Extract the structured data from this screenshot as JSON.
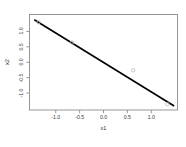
{
  "chart_data": {
    "type": "scatter",
    "title": "",
    "xlabel": "x1",
    "ylabel": "x2",
    "xlim": [
      -1.55,
      1.55
    ],
    "ylim": [
      -1.55,
      1.55
    ],
    "grid": false,
    "legend": null,
    "xticks": [
      "-1.0",
      "-0.5",
      "0.0",
      "0.5",
      "1.0"
    ],
    "xtick_values": [
      -1.0,
      -0.5,
      0.0,
      0.5,
      1.0
    ],
    "yticks": [
      "-1.0",
      "-0.5",
      "0.0",
      "0.5",
      "1.0"
    ],
    "ytick_values": [
      -1.0,
      -0.5,
      0.0,
      0.5,
      1.0
    ],
    "points": [
      {
        "x": -1.36,
        "y": 1.3
      },
      {
        "x": -0.66,
        "y": 0.64
      },
      {
        "x": 0.62,
        "y": -0.26
      },
      {
        "x": 1.34,
        "y": -1.36
      }
    ],
    "line": {
      "name": "fitted-line",
      "x_start": -1.45,
      "y_start": 1.38,
      "x_end": 1.48,
      "y_end": -1.42,
      "slope": -0.955,
      "intercept": -0.005,
      "color": "#000000",
      "width": 1.6
    },
    "style": {
      "point_color": "#b9b9b9",
      "point_radius": 1.7,
      "frame_color": "#8c8c8c",
      "tick_color": "#8c8c8c",
      "background": "#ffffff",
      "text_color": "#3b3b3b"
    }
  }
}
